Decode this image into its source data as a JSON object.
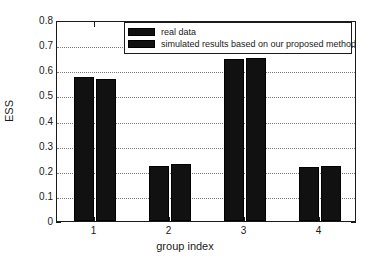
{
  "chart_data": {
    "type": "bar",
    "title": "",
    "xlabel": "group index",
    "ylabel": "ESS",
    "categories": [
      "1",
      "2",
      "3",
      "4"
    ],
    "series": [
      {
        "name": "real data",
        "values": [
          0.573,
          0.219,
          0.645,
          0.215
        ],
        "color": "#111111"
      },
      {
        "name": "simulated results based on our proposed method",
        "values": [
          0.565,
          0.227,
          0.648,
          0.219
        ],
        "color": "#111111"
      }
    ],
    "ylim": [
      0,
      0.8
    ],
    "yticks": [
      "0",
      "0.1",
      "0.2",
      "0.3",
      "0.4",
      "0.5",
      "0.6",
      "0.7",
      "0.8"
    ],
    "ytick_values": [
      0,
      0.1,
      0.2,
      0.3,
      0.4,
      0.5,
      0.6,
      0.7,
      0.8
    ],
    "xtick_values": [
      1,
      2,
      3,
      4
    ],
    "grid": true,
    "grid_axis": "y",
    "legend_position": "top-center",
    "axis_color": "#1a1a1a",
    "grid_color": "#7d7d7d",
    "background": "#ffffff"
  }
}
